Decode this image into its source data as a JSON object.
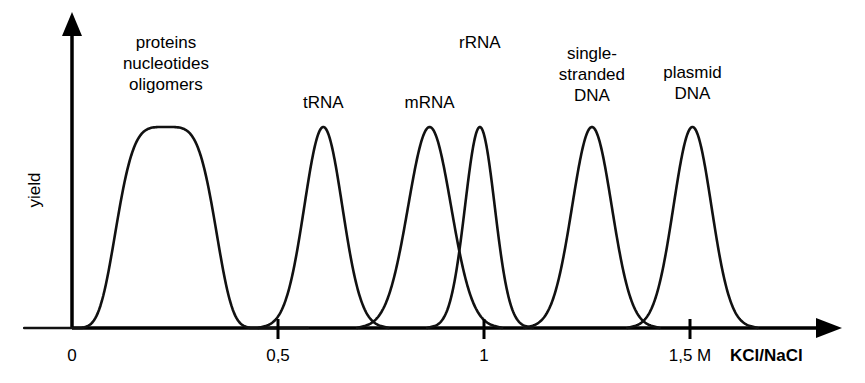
{
  "chart_data": {
    "type": "line",
    "title": "",
    "subtitle": "",
    "xlabel": "KCl/NaCl",
    "ylabel": "yield",
    "xlim": [
      0,
      1.87
    ],
    "ylim": [
      0,
      1.05
    ],
    "grid": false,
    "legend": "none",
    "x_unit_label": "M",
    "x_ticks": [
      {
        "value": 0,
        "label": "0",
        "show_mark": false
      },
      {
        "value": 0.5,
        "label": "0,5",
        "show_mark": true
      },
      {
        "value": 1,
        "label": "1",
        "show_mark": true
      },
      {
        "value": 1.5,
        "label": "1,5 M",
        "show_mark": true
      }
    ],
    "y_ticks": [],
    "axis_arrows": {
      "x": true,
      "y": true
    },
    "series": [
      {
        "name": "proteins nucleotides oligomers",
        "label": "proteins\nnucleotides\noligomers",
        "center": 0.228,
        "height": 1.0,
        "width": 0.108,
        "flat_top": true,
        "label_x": 0.228,
        "label_top_px": 32
      },
      {
        "name": "tRNA",
        "label": "tRNA",
        "center": 0.61,
        "height": 1.0,
        "width": 0.046,
        "flat_top": false,
        "label_x": 0.61,
        "label_top_px": 92
      },
      {
        "name": "mRNA",
        "label": "mRNA",
        "center": 0.868,
        "height": 1.0,
        "width": 0.052,
        "flat_top": false,
        "label_x": 0.868,
        "label_top_px": 92
      },
      {
        "name": "rRNA",
        "label": "rRNA",
        "center": 0.99,
        "height": 1.0,
        "width": 0.036,
        "flat_top": false,
        "label_x": 0.99,
        "label_top_px": 32
      },
      {
        "name": "single-stranded DNA",
        "label": "single-\nstranded\nDNA",
        "center": 1.262,
        "height": 1.0,
        "width": 0.048,
        "flat_top": false,
        "label_x": 1.262,
        "label_top_px": 43
      },
      {
        "name": "plasmid DNA",
        "label": "plasmid\nDNA",
        "center": 1.506,
        "height": 1.0,
        "width": 0.046,
        "flat_top": false,
        "label_x": 1.506,
        "label_top_px": 62
      }
    ],
    "line_color": "#111111",
    "axis_color": "#000000",
    "background_color": "#ffffff"
  }
}
